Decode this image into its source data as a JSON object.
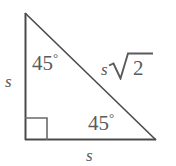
{
  "figure": {
    "type": "geometry-diagram",
    "shape": "right-isosceles-triangle",
    "background_color": "#ffffff",
    "stroke_color": "#4a4a4a",
    "text_color": "#5a5a5a",
    "vertices": {
      "top_left": [
        25,
        13
      ],
      "bottom_left": [
        25,
        140
      ],
      "bottom_right": [
        156,
        140
      ]
    },
    "right_angle_marker": {
      "name": "right-angle-square",
      "x": 25,
      "y": 118,
      "size": 22
    },
    "angles": [
      {
        "name": "angle-top-left",
        "value": "45",
        "degree_symbol": "°"
      },
      {
        "name": "angle-bottom-right",
        "value": "45",
        "degree_symbol": "°"
      }
    ],
    "sides": {
      "left_leg": "s",
      "bottom_leg": "s",
      "hypotenuse_coefficient": "s",
      "hypotenuse_radicand": "2"
    }
  }
}
